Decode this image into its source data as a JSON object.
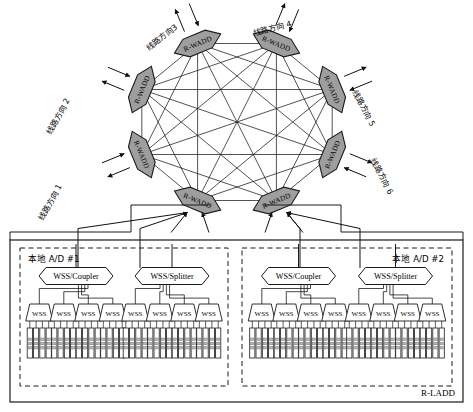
{
  "diagram": {
    "title_label": "R-LADD",
    "ring": {
      "node_label": "R-WADD",
      "node_count": 8,
      "mesh": "full",
      "node_fill": "#9e9e9e",
      "node_stroke": "#1a1a1a"
    },
    "directions": [
      {
        "id": 1,
        "label": "线路方向 1"
      },
      {
        "id": 2,
        "label": "线路方向 2"
      },
      {
        "id": 3,
        "label": "线路方向3"
      },
      {
        "id": 4,
        "label": "线路方向 4"
      },
      {
        "id": 5,
        "label": "线路方向 5"
      },
      {
        "id": 6,
        "label": "线路方向 6"
      }
    ],
    "ad_blocks": [
      {
        "label": "本地 A/D #1",
        "groups": [
          {
            "octagon_label": "WSS/Coupler",
            "wss_label": "WSS",
            "wss_count": 4,
            "transponders_per_wss": 4
          },
          {
            "octagon_label": "WSS/Splitter",
            "wss_label": "WSS",
            "wss_count": 4,
            "transponders_per_wss": 4
          }
        ]
      },
      {
        "label": "本地 A/D #2",
        "groups": [
          {
            "octagon_label": "WSS/Coupler",
            "wss_label": "WSS",
            "wss_count": 4,
            "transponders_per_wss": 4
          },
          {
            "octagon_label": "WSS/Splitter",
            "wss_label": "WSS",
            "wss_count": 4,
            "transponders_per_wss": 4
          }
        ]
      }
    ]
  }
}
